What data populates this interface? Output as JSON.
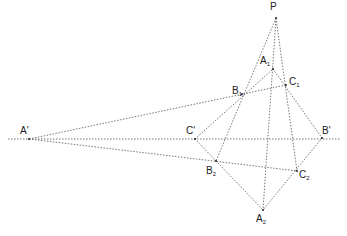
{
  "diagram": {
    "type": "projective-geometry-construction",
    "line_color": "#555555",
    "line_style": "dotted",
    "points": [
      {
        "id": "P",
        "label": "P",
        "sub": "",
        "x": 276,
        "y": 18,
        "lx": 270,
        "ly": 2
      },
      {
        "id": "A1",
        "label": "A",
        "sub": "1",
        "x": 273,
        "y": 69,
        "lx": 260,
        "ly": 56
      },
      {
        "id": "B1",
        "label": "B",
        "sub": "1",
        "x": 242,
        "y": 94,
        "lx": 232,
        "ly": 86
      },
      {
        "id": "C1",
        "label": "C",
        "sub": "1",
        "x": 286,
        "y": 85,
        "lx": 289,
        "ly": 77
      },
      {
        "id": "A'",
        "label": "A'",
        "sub": "",
        "x": 29,
        "y": 139,
        "lx": 20,
        "ly": 126
      },
      {
        "id": "C'",
        "label": "C'",
        "sub": "",
        "x": 195,
        "y": 139,
        "lx": 186,
        "ly": 126
      },
      {
        "id": "B'",
        "label": "B'",
        "sub": "",
        "x": 322,
        "y": 138,
        "lx": 322,
        "ly": 126
      },
      {
        "id": "B2",
        "label": "B",
        "sub": "2",
        "x": 216,
        "y": 161,
        "lx": 206,
        "ly": 166
      },
      {
        "id": "C2",
        "label": "C",
        "sub": "2",
        "x": 297,
        "y": 171,
        "lx": 299,
        "ly": 170
      },
      {
        "id": "A2",
        "label": "A",
        "sub": "2",
        "x": 263,
        "y": 210,
        "lx": 256,
        "ly": 214
      }
    ],
    "lines": [
      {
        "from": [
          8,
          139
        ],
        "to": [
          341,
          139
        ],
        "name": "axis-line"
      },
      {
        "from": [
          276,
          18
        ],
        "to": [
          216,
          161
        ],
        "name": "line-P-B1-B2"
      },
      {
        "from": [
          276,
          18
        ],
        "to": [
          263,
          210
        ],
        "name": "line-P-A1-A2"
      },
      {
        "from": [
          276,
          18
        ],
        "to": [
          297,
          171
        ],
        "name": "line-P-C1-C2"
      },
      {
        "from": [
          29,
          139
        ],
        "to": [
          286,
          85
        ],
        "name": "line-Aprime-B1-C1"
      },
      {
        "from": [
          29,
          139
        ],
        "to": [
          297,
          171
        ],
        "name": "line-Aprime-B2-C2"
      },
      {
        "from": [
          195,
          139
        ],
        "to": [
          273,
          69
        ],
        "name": "line-Cprime-B1-A1"
      },
      {
        "from": [
          273,
          69
        ],
        "to": [
          322,
          138
        ],
        "name": "line-A1-C1-Bprime"
      },
      {
        "from": [
          195,
          139
        ],
        "to": [
          263,
          210
        ],
        "name": "line-Cprime-B2-A2"
      },
      {
        "from": [
          322,
          138
        ],
        "to": [
          263,
          210
        ],
        "name": "line-Bprime-C2-A2"
      }
    ]
  }
}
